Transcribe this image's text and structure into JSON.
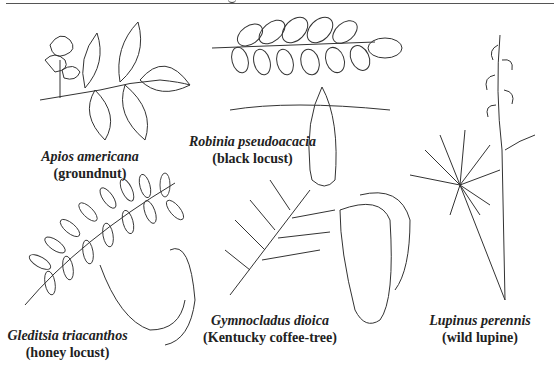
{
  "figure": {
    "title_partial": "g",
    "plants": [
      {
        "scientific": "Apios americana",
        "common": "(groundnut)"
      },
      {
        "scientific": "Robinia pseudoacacia",
        "common": "(black locust)"
      },
      {
        "scientific": "Gleditsia triacanthos",
        "common": "(honey locust)"
      },
      {
        "scientific": "Gymnocladus dioica",
        "common": "(Kentucky coffee-tree)"
      },
      {
        "scientific": "Lupinus perennis",
        "common": "(wild lupine)"
      }
    ]
  }
}
